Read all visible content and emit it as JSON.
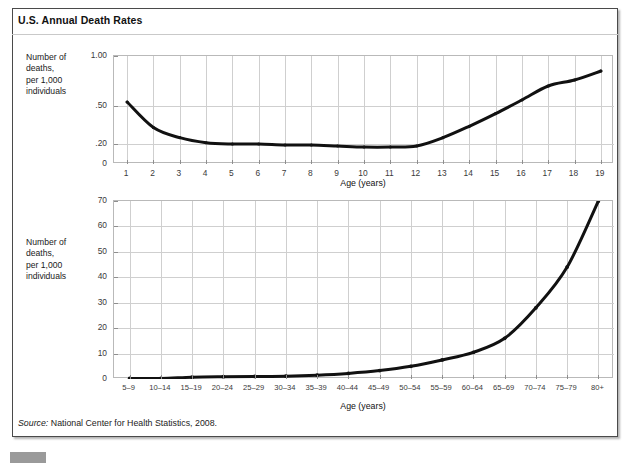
{
  "figure": {
    "title": "U.S. Annual Death Rates",
    "source_prefix": "Source:",
    "source_text": " National Center for Health Statistics, 2008."
  },
  "chart_data": [
    {
      "id": "top",
      "type": "line",
      "title": "U.S. Annual Death Rates",
      "xlabel": "Age (years)",
      "ylabel": "Number of\ndeaths,\nper 1,000\nindividuals",
      "categories": [
        "1",
        "2",
        "3",
        "4",
        "5",
        "6",
        "7",
        "8",
        "9",
        "10",
        "11",
        "12",
        "13",
        "14",
        "15",
        "16",
        "17",
        "18",
        "19"
      ],
      "x": [
        1,
        2,
        3,
        4,
        5,
        6,
        7,
        8,
        9,
        10,
        11,
        12,
        13,
        14,
        15,
        16,
        17,
        18,
        19
      ],
      "values": [
        0.54,
        0.33,
        0.25,
        0.21,
        0.2,
        0.2,
        0.19,
        0.19,
        0.18,
        0.17,
        0.17,
        0.18,
        0.25,
        0.34,
        0.44,
        0.56,
        0.7,
        0.76,
        0.85
      ],
      "ytick_labels": [
        "0",
        ".20",
        ".50",
        "1.00"
      ],
      "ytick_values": [
        0,
        0.2,
        0.5,
        1.0
      ],
      "yscale": "nonlinear",
      "ylim": [
        0,
        1.0
      ],
      "grid": true,
      "legend": "none",
      "line_color": "#111111"
    },
    {
      "id": "bottom",
      "type": "line",
      "title": "U.S. Annual Death Rates",
      "xlabel": "Age (years)",
      "ylabel": "Number of\ndeaths,\nper 1,000\nindividuals",
      "categories": [
        "5–9",
        "10–14",
        "15–19",
        "20–24",
        "25–29",
        "30–34",
        "35–39",
        "40–44",
        "45–49",
        "50–54",
        "55–59",
        "60–64",
        "65–69",
        "70–74",
        "75–79",
        "80+"
      ],
      "values": [
        0.2,
        0.2,
        0.7,
        0.9,
        1.0,
        1.1,
        1.5,
        2.2,
        3.3,
        5.0,
        7.5,
        10.5,
        16.0,
        28.0,
        44.0,
        70.0
      ],
      "ytick_labels": [
        "0",
        "10",
        "20",
        "30",
        "40",
        "50",
        "60",
        "70"
      ],
      "ytick_values": [
        0,
        10,
        20,
        30,
        40,
        50,
        60,
        70
      ],
      "yscale": "linear",
      "ylim": [
        0,
        70
      ],
      "grid": true,
      "legend": "none",
      "line_color": "#111111"
    }
  ]
}
